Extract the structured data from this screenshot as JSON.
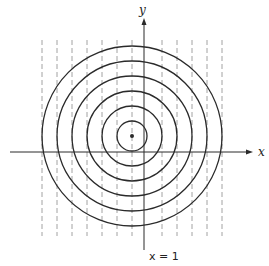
{
  "diagram": {
    "colors": {
      "stroke": "#2a2a2a",
      "dashed": "#8a8a8a",
      "background": "#ffffff"
    },
    "axes": {
      "x_label": "x",
      "y_label": "y",
      "origin_px": [
        144,
        152
      ],
      "x_axis": {
        "from": 10,
        "to": 253
      },
      "y_axis": {
        "from": 250,
        "to": 18
      }
    },
    "center_px": [
      132,
      136
    ],
    "circle_radii_px": [
      15,
      30,
      45,
      60,
      75,
      90
    ],
    "dashed_lines_x_px": [
      42,
      57,
      72,
      87,
      102,
      117,
      132,
      162,
      177,
      192,
      207,
      222
    ],
    "dashed_y_range_px": [
      40,
      236
    ],
    "line_label": "x = 1"
  }
}
